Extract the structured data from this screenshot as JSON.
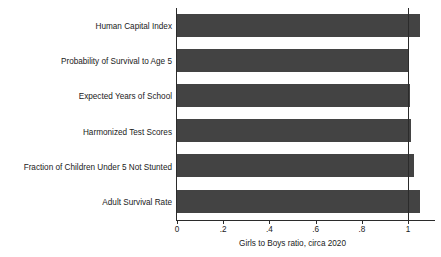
{
  "chart_data": {
    "type": "bar",
    "orientation": "horizontal",
    "title": "",
    "subtitle": "",
    "xlabel": "Girls to Boys ratio, circa 2020",
    "ylabel": "",
    "xlim": [
      0,
      1.12
    ],
    "xticks": [
      0,
      0.2,
      0.4,
      0.6,
      0.8,
      1
    ],
    "xticklabels": [
      "0",
      ".2",
      ".4",
      ".6",
      ".8",
      "1"
    ],
    "grid": false,
    "legend": null,
    "reference_line": {
      "value": 1,
      "label": "",
      "color": "#2b2b2b"
    },
    "bar_color": "#434343",
    "categories": [
      "Human Capital Index",
      "Probability of Survival to Age 5",
      "Expected Years of School",
      "Harmonized Test Scores",
      "Fraction of Children Under 5 Not Stunted",
      "Adult Survival Rate"
    ],
    "values": [
      1.05,
      1.0,
      1.01,
      1.015,
      1.025,
      1.05
    ]
  },
  "axis": {
    "x_title": "Girls to Boys ratio, circa 2020"
  }
}
